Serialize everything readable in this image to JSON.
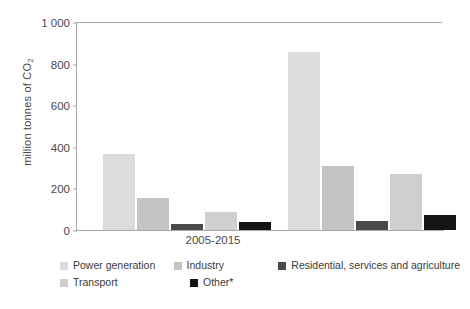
{
  "chart_data": {
    "type": "bar",
    "title": "",
    "xlabel": "",
    "ylabel": "million tonnes of CO2",
    "ylabel_main": "million tonnes of CO",
    "ylabel_sub": "2",
    "ylim": [
      0,
      1000
    ],
    "yticks": [
      0,
      200,
      400,
      600,
      800,
      1000
    ],
    "ytick_labels": [
      "0",
      "200",
      "400",
      "600",
      "800",
      "1 000"
    ],
    "grid": false,
    "legend_position": "bottom",
    "categories": [
      "2005-2015",
      "2015-2030"
    ],
    "series": [
      {
        "name": "Power generation",
        "color": "#dcdcdc",
        "values": [
          365,
          855
        ]
      },
      {
        "name": "Industry",
        "color": "#c4c4c4",
        "values": [
          152,
          308
        ]
      },
      {
        "name": "Residential, services and agriculture",
        "color": "#4a4a4a",
        "values": [
          28,
          45
        ]
      },
      {
        "name": "Transport",
        "color": "#cfcfcf",
        "values": [
          85,
          270
        ]
      },
      {
        "name": "Other*",
        "color": "#151515",
        "values": [
          38,
          70
        ]
      }
    ]
  },
  "legend": {
    "items": [
      {
        "label": "Power generation",
        "color": "#dcdcdc"
      },
      {
        "label": "Industry",
        "color": "#c4c4c4"
      },
      {
        "label": "Residential, services and agriculture",
        "color": "#4a4a4a"
      },
      {
        "label": "Transport",
        "color": "#cfcfcf"
      },
      {
        "label": "Other*",
        "color": "#151515"
      }
    ]
  },
  "axis": {
    "color": "#a8a8a8"
  }
}
